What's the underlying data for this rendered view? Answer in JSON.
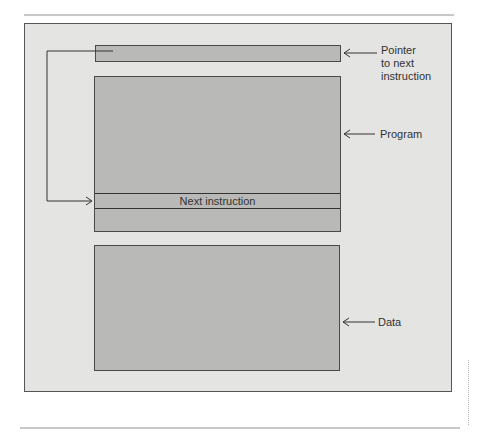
{
  "diagram": {
    "type": "memory-layout",
    "boxes": {
      "pointer": {
        "label": ""
      },
      "program": {
        "label": "",
        "inner_row": "Next instruction"
      },
      "data": {
        "label": ""
      }
    },
    "annotations": {
      "pointer": "Pointer\nto next\ninstruction",
      "pointer_lines": [
        "Pointer",
        "to next",
        "instruction"
      ],
      "program": "Program",
      "data": "Data"
    },
    "arrows": [
      {
        "from": "pointer-box",
        "to": "next-instruction-row",
        "style": "elbow-left"
      },
      {
        "from": "pointer-label",
        "to": "pointer-box"
      },
      {
        "from": "program-label",
        "to": "program-box"
      },
      {
        "from": "data-label",
        "to": "data-box"
      }
    ],
    "colors": {
      "frame_bg": "#e4e4e2",
      "box_fill": "#b9b9b7",
      "stroke": "#333333"
    }
  }
}
